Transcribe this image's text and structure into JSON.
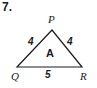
{
  "figure": {
    "problem_number": "7.",
    "shape": "triangle",
    "stroke_color": "#1a1a1a",
    "background_color": "#ffffff",
    "region_label": "A",
    "vertices": [
      {
        "name": "P",
        "label": "P",
        "x": 52,
        "y": 30
      },
      {
        "name": "Q",
        "label": "Q",
        "x": 17,
        "y": 67
      },
      {
        "name": "R",
        "label": "R",
        "x": 82,
        "y": 67
      }
    ],
    "sides": [
      {
        "name": "PQ",
        "label": "4"
      },
      {
        "name": "PR",
        "label": "4"
      },
      {
        "name": "QR",
        "label": "5"
      }
    ]
  }
}
